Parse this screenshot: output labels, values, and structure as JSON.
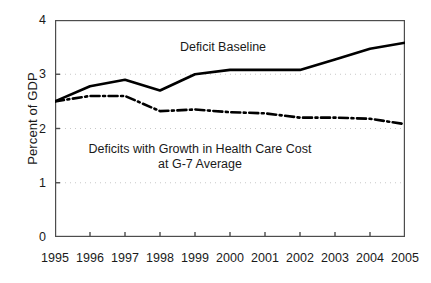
{
  "chart_data": {
    "type": "line",
    "title": "",
    "xlabel": "",
    "ylabel": "Percent of GDP",
    "x": [
      1995,
      1996,
      1997,
      1998,
      1999,
      2000,
      2001,
      2002,
      2003,
      2004,
      2005
    ],
    "xticklabels": [
      "1995",
      "1996",
      "1997",
      "1998",
      "1999",
      "2000",
      "2001",
      "2002",
      "2003",
      "2004",
      "2005"
    ],
    "yticklabels": [
      "0",
      "1",
      "2",
      "3",
      "4"
    ],
    "yticks": [
      0,
      1,
      2,
      3,
      4
    ],
    "ylim": [
      0,
      4
    ],
    "xlim": [
      1995,
      2005
    ],
    "grid": "horizontal-dotted",
    "legend": "none-inline-annotations",
    "series": [
      {
        "name": "Deficit Baseline",
        "style": "solid",
        "color": "#000000",
        "values": [
          2.5,
          2.78,
          2.9,
          2.7,
          3.0,
          3.08,
          3.08,
          3.08,
          3.27,
          3.47,
          3.58
        ]
      },
      {
        "name": "Deficits with Growth in Health Care Cost at G-7 Average",
        "style": "dash-dot",
        "color": "#000000",
        "values": [
          2.5,
          2.6,
          2.6,
          2.32,
          2.35,
          2.3,
          2.28,
          2.2,
          2.2,
          2.18,
          2.08
        ]
      }
    ],
    "annotations": [
      {
        "text": "Deficit Baseline",
        "series": "Deficit Baseline"
      },
      {
        "line1": "Deficits with Growth in Health Care Cost",
        "line2": "at G-7 Average",
        "series": "Deficits with Growth in Health Care Cost at G-7 Average"
      }
    ]
  },
  "axis": {
    "ylabel": "Percent of GDP"
  },
  "annotations": {
    "baseline_label": "Deficit Baseline",
    "g7_label_line1": "Deficits with Growth in Health Care Cost",
    "g7_label_line2": "at G-7 Average"
  },
  "colors": {
    "line": "#000000",
    "grid": "#c8c8c8",
    "frame": "#4d4d4d",
    "text": "#1a1a1a",
    "background": "#ffffff"
  }
}
